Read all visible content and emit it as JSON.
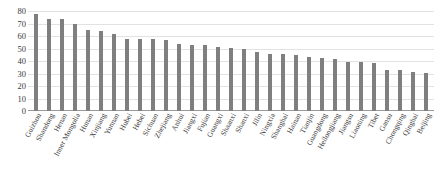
{
  "chart_data": {
    "type": "bar",
    "title": "",
    "xlabel": "",
    "ylabel": "",
    "ylim": [
      0,
      80
    ],
    "yticks": [
      0,
      10,
      20,
      30,
      40,
      50,
      60,
      70,
      80
    ],
    "grid": true,
    "legend": "none",
    "bar_color": "#7f7f7f",
    "categories": [
      "Guizhou",
      "Shandong",
      "Henan",
      "Inner Mongolia",
      "Hunan",
      "Xinjiang",
      "Yunnan",
      "Hubei",
      "Hebei",
      "Sichuan",
      "Zhejiang",
      "Anhui",
      "Jiangxi",
      "Fujian",
      "Guangxi",
      "Shaanxi",
      "Shanxi",
      "Jilin",
      "Ningxia",
      "Shanghai",
      "Hainan",
      "Tianjin",
      "Guangdong",
      "Heilongjiang",
      "Jiangsu",
      "Liaoning",
      "Tibet",
      "Gansu",
      "Chongqing",
      "Qinghai",
      "Beijing"
    ],
    "values": [
      78,
      74,
      73.5,
      69.5,
      65,
      64,
      61.5,
      58,
      57.5,
      57.5,
      57,
      53.5,
      53,
      52.5,
      51.5,
      50.5,
      49.5,
      47.5,
      46,
      45.5,
      44.5,
      43.5,
      42.5,
      42,
      39.5,
      39,
      38.5,
      33,
      32.5,
      31.5,
      30.5
    ]
  }
}
